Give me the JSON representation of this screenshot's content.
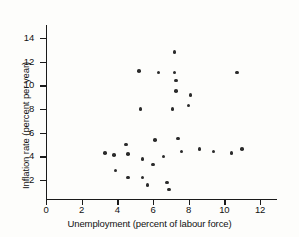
{
  "chart_data": {
    "type": "scatter",
    "title": "",
    "xlabel": "Unemployment (percent of labour force)",
    "ylabel": "Inflation rate (percent per year)",
    "xlim": [
      0,
      13
    ],
    "ylim": [
      0,
      15
    ],
    "xticks": [
      0,
      2,
      4,
      6,
      8,
      10,
      12
    ],
    "yticks": [
      2,
      4,
      6,
      8,
      10,
      12,
      14
    ],
    "grid": false,
    "legend": null,
    "marker": "filled-circle",
    "marker_color": "#2b2b2b",
    "points": [
      {
        "x": 3.3,
        "y": 4.3
      },
      {
        "x": 3.8,
        "y": 4.1
      },
      {
        "x": 3.9,
        "y": 2.8
      },
      {
        "x": 4.5,
        "y": 5.0
      },
      {
        "x": 4.6,
        "y": 4.2
      },
      {
        "x": 4.6,
        "y": 2.2
      },
      {
        "x": 5.2,
        "y": 11.2
      },
      {
        "x": 5.3,
        "y": 8.0
      },
      {
        "x": 5.4,
        "y": 2.2
      },
      {
        "x": 5.4,
        "y": 3.8
      },
      {
        "x": 5.7,
        "y": 1.6
      },
      {
        "x": 6.0,
        "y": 3.3
      },
      {
        "x": 6.1,
        "y": 5.4
      },
      {
        "x": 6.3,
        "y": 11.1
      },
      {
        "x": 6.6,
        "y": 4.0
      },
      {
        "x": 6.8,
        "y": 1.8
      },
      {
        "x": 6.9,
        "y": 1.2
      },
      {
        "x": 7.1,
        "y": 8.0
      },
      {
        "x": 7.2,
        "y": 12.8
      },
      {
        "x": 7.2,
        "y": 11.1
      },
      {
        "x": 7.3,
        "y": 10.4
      },
      {
        "x": 7.3,
        "y": 9.5
      },
      {
        "x": 7.4,
        "y": 5.5
      },
      {
        "x": 7.6,
        "y": 4.4
      },
      {
        "x": 8.0,
        "y": 8.3
      },
      {
        "x": 8.1,
        "y": 9.2
      },
      {
        "x": 8.6,
        "y": 4.6
      },
      {
        "x": 9.4,
        "y": 4.4
      },
      {
        "x": 10.4,
        "y": 4.3
      },
      {
        "x": 10.7,
        "y": 11.1
      },
      {
        "x": 11.0,
        "y": 4.6
      }
    ]
  },
  "axes": {
    "x_title": "Unemployment (percent of labour force)",
    "y_title": "Inflation rate (percent per year)",
    "x_tick_labels": [
      "0",
      "2",
      "4",
      "6",
      "8",
      "10",
      "12"
    ],
    "y_tick_labels": [
      "2",
      "4",
      "6",
      "8",
      "10",
      "12",
      "14"
    ]
  }
}
